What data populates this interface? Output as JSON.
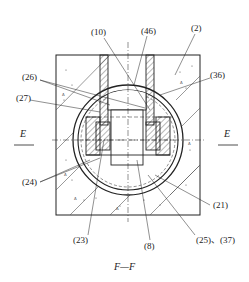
{
  "figure": {
    "caption": "F—F",
    "section_marker_left": "E",
    "section_marker_right": "E"
  },
  "labels": {
    "l10": "(10)",
    "l46": "(46)",
    "l2": "(2)",
    "l26": "(26)",
    "l36": "(36)",
    "l27": "(27)",
    "l24": "(24)",
    "l21": "(21)",
    "l23": "(23)",
    "l8": "(8)",
    "l25_37": "(25)、(37)"
  },
  "colors": {
    "line": "#222222",
    "background": "#ffffff"
  }
}
